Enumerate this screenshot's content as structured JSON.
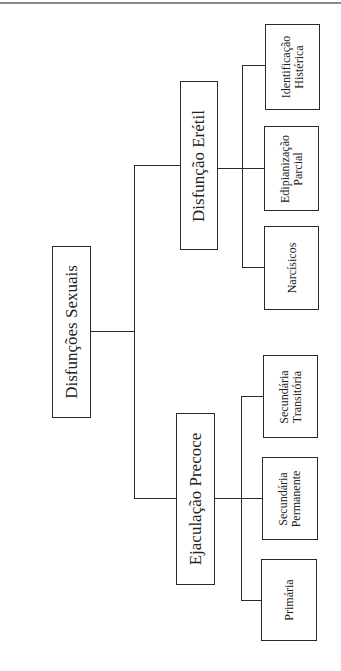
{
  "diagram": {
    "root": {
      "label": "Disfunções Sexuais"
    },
    "branches": [
      {
        "label": "Disfunção Erétil",
        "children": [
          {
            "lines": [
              "Narcísicos"
            ]
          },
          {
            "lines": [
              "Edipianização",
              "Parcial"
            ]
          },
          {
            "lines": [
              "Identificação",
              "Histérica"
            ]
          }
        ]
      },
      {
        "label": "Ejaculação Precoce",
        "children": [
          {
            "lines": [
              "Primária"
            ]
          },
          {
            "lines": [
              "Secundária",
              "Permanente"
            ]
          },
          {
            "lines": [
              "Secundária",
              "Transitória"
            ]
          }
        ]
      }
    ]
  }
}
